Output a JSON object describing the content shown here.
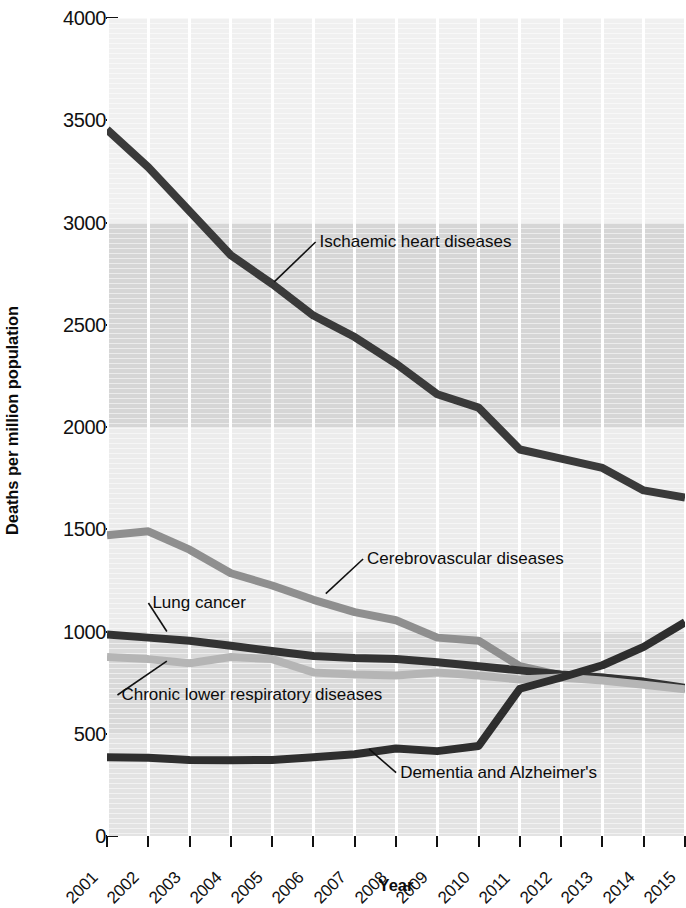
{
  "chart_data": {
    "type": "line",
    "title": "",
    "xlabel": "Year",
    "ylabel": "Deaths per million population",
    "x": [
      2001,
      2002,
      2003,
      2004,
      2005,
      2006,
      2007,
      2008,
      2009,
      2010,
      2011,
      2012,
      2013,
      2014,
      2015
    ],
    "categories": [
      "2001",
      "2002",
      "2003",
      "2004",
      "2005",
      "2006",
      "2007",
      "2008",
      "2009",
      "2010",
      "2011",
      "2012",
      "2013",
      "2014",
      "2015"
    ],
    "xlim": [
      2001,
      2015
    ],
    "ylim": [
      0,
      4000
    ],
    "yticks": [
      0,
      500,
      1000,
      1500,
      2000,
      2500,
      3000,
      3500,
      4000
    ],
    "ytick_labels": [
      "0",
      "500",
      "1000",
      "1500",
      "2000",
      "2500",
      "3000",
      "3500",
      "4000"
    ],
    "grid": "vertical white gridlines on grey banded background",
    "legend": "inline labels with leader lines",
    "series": [
      {
        "name": "Ischaemic heart diseases",
        "color": "#3a3a3a",
        "values": [
          3455,
          3270,
          3055,
          2840,
          2700,
          2545,
          2440,
          2310,
          2160,
          2095,
          1890,
          1845,
          1800,
          1690,
          1655
        ],
        "label_x": 2006.15,
        "label_y": 2880,
        "leader_from_x": 2005.05,
        "leader_from_y": 2710
      },
      {
        "name": "Cerebrovascular diseases",
        "color": "#8f8f8f",
        "values": [
          1470,
          1490,
          1400,
          1285,
          1225,
          1155,
          1095,
          1055,
          970,
          955,
          830,
          785,
          775,
          750,
          720
        ],
        "label_x": 2007.3,
        "label_y": 1330,
        "leader_from_x": 2006.3,
        "leader_from_y": 1185
      },
      {
        "name": "Lung cancer",
        "color": "#333333",
        "values": [
          985,
          970,
          955,
          930,
          905,
          880,
          870,
          865,
          850,
          830,
          810,
          790,
          775,
          755,
          725
        ],
        "label_x": 2002.1,
        "label_y": 1115,
        "leader_from_x": 2002.45,
        "leader_from_y": 1000
      },
      {
        "name": "Chronic lower respiratory diseases",
        "color": "#b5b5b5",
        "values": [
          875,
          865,
          845,
          875,
          865,
          800,
          790,
          785,
          800,
          785,
          765,
          775,
          760,
          740,
          718
        ],
        "label_x": 2001.35,
        "label_y": 665,
        "leader_from_x": 2002.45,
        "leader_from_y": 855
      },
      {
        "name": "Dementia and Alzheimer's",
        "color": "#2e2e2e",
        "values": [
          385,
          383,
          372,
          370,
          372,
          385,
          400,
          428,
          415,
          440,
          720,
          775,
          835,
          925,
          1045
        ],
        "label_x": 2008.1,
        "label_y": 285,
        "leader_from_x": 2007.35,
        "leader_from_y": 425
      }
    ]
  },
  "axes": {
    "y_title": "Deaths per million population",
    "x_title": "Year"
  }
}
